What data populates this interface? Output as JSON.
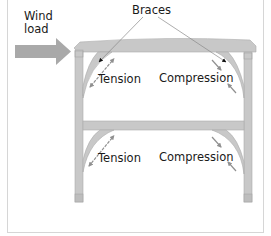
{
  "diagram": {
    "title_labels": {
      "wind_line1": "Wind",
      "wind_line2": "load",
      "braces": "Braces"
    },
    "upper_story": {
      "left_label": "Tension",
      "right_label": "Compression"
    },
    "lower_story": {
      "left_label": "Tension",
      "right_label": "Compression"
    },
    "colors": {
      "timber": "#c8c8c8",
      "timber_edge": "#a8a8a8",
      "wind_arrow": "#a9a9a9",
      "force_arrow": "#909090",
      "pointer_line": "#8a8a8a",
      "text": "#1a1a1a"
    },
    "icons": [
      "wind-arrow-icon",
      "tension-arrow-icon",
      "compression-arrow-icon",
      "pointer-arrow-icon"
    ]
  }
}
